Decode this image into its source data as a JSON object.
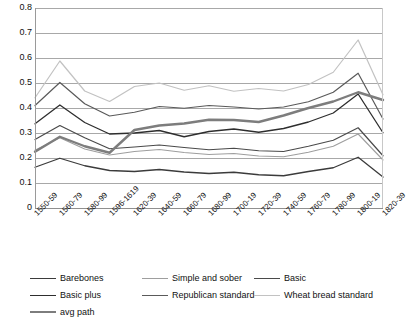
{
  "chart_data": {
    "type": "line",
    "title": "",
    "xlabel": "",
    "ylabel": "",
    "ylim": [
      0,
      0.8
    ],
    "ytick_step": 0.1,
    "grid": true,
    "legend_position": "bottom",
    "yticks": [
      "0.8",
      "0.7",
      "0.6",
      "0.5",
      "0.4",
      "0.3",
      "0.2",
      "0.1",
      "0"
    ],
    "ytick_values": [
      0.8,
      0.7,
      0.6,
      0.5,
      0.4,
      0.3,
      0.2,
      0.1,
      0
    ],
    "categories": [
      "1550-59",
      "1560-79",
      "1580-99",
      "1596-1619",
      "1620-39",
      "1640-59",
      "1660-79",
      "1680-99",
      "1700-19",
      "1720-39",
      "1740-59",
      "1760-79",
      "1780-99",
      "1800-19",
      "1820-39"
    ],
    "series": [
      {
        "name": "Barebones",
        "color": "#3b3b3b",
        "width": 1.3,
        "values": [
          0.163,
          0.199,
          0.169,
          0.15,
          0.146,
          0.154,
          0.144,
          0.138,
          0.143,
          0.133,
          0.129,
          0.146,
          0.161,
          0.203,
          0.124
        ]
      },
      {
        "name": "Simple and sober",
        "color": "#9e9e9e",
        "width": 1.1,
        "values": [
          0.231,
          0.281,
          0.236,
          0.212,
          0.226,
          0.234,
          0.222,
          0.214,
          0.218,
          0.208,
          0.205,
          0.223,
          0.247,
          0.296,
          0.192
        ]
      },
      {
        "name": "Basic",
        "color": "#4a4a4a",
        "width": 1.2,
        "values": [
          0.274,
          0.33,
          0.281,
          0.237,
          0.244,
          0.252,
          0.242,
          0.233,
          0.239,
          0.229,
          0.226,
          0.247,
          0.271,
          0.321,
          0.209
        ]
      },
      {
        "name": "Basic plus",
        "color": "#2e2e2e",
        "width": 1.3,
        "values": [
          0.337,
          0.412,
          0.342,
          0.296,
          0.3,
          0.31,
          0.285,
          0.306,
          0.316,
          0.303,
          0.318,
          0.344,
          0.38,
          0.456,
          0.301
        ]
      },
      {
        "name": "Republican standard",
        "color": "#5a5a5a",
        "width": 1.2,
        "values": [
          0.41,
          0.502,
          0.417,
          0.368,
          0.383,
          0.406,
          0.399,
          0.41,
          0.404,
          0.396,
          0.404,
          0.425,
          0.463,
          0.539,
          0.356
        ]
      },
      {
        "name": "Wheat bread standard",
        "color": "#c2c2c2",
        "width": 1.2,
        "values": [
          0.441,
          0.588,
          0.468,
          0.426,
          0.486,
          0.5,
          0.471,
          0.489,
          0.467,
          0.478,
          0.468,
          0.494,
          0.543,
          0.672,
          0.453
        ]
      },
      {
        "name": "avg path",
        "color": "#7d7d7d",
        "width": 2.4,
        "values": [
          0.225,
          0.285,
          0.247,
          0.221,
          0.312,
          0.33,
          0.338,
          0.353,
          0.352,
          0.344,
          0.37,
          0.4,
          0.426,
          0.463,
          0.432
        ]
      }
    ]
  },
  "legend": {
    "items": [
      {
        "label": "Barebones",
        "color": "#3b3b3b",
        "width": 1.3
      },
      {
        "label": "Simple and sober",
        "color": "#9e9e9e",
        "width": 1.1
      },
      {
        "label": "Basic",
        "color": "#4a4a4a",
        "width": 1.2
      },
      {
        "label": "Basic plus",
        "color": "#2e2e2e",
        "width": 1.3
      },
      {
        "label": "Republican standard",
        "color": "#5a5a5a",
        "width": 1.2
      },
      {
        "label": "Wheat bread standard",
        "color": "#c2c2c2",
        "width": 1.2
      },
      {
        "label": "avg path",
        "color": "#7d7d7d",
        "width": 2.4
      }
    ]
  }
}
